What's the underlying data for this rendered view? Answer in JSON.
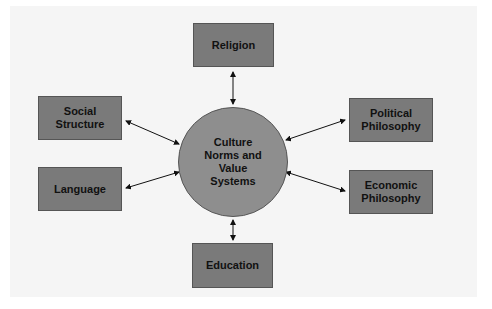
{
  "diagram": {
    "center": {
      "label": "Culture\nNorms and\nValue\nSystems"
    },
    "nodes": [
      {
        "id": "religion",
        "label": "Religion"
      },
      {
        "id": "social-structure",
        "label": "Social\nStructure"
      },
      {
        "id": "language",
        "label": "Language"
      },
      {
        "id": "political-philosophy",
        "label": "Political\nPhilosophy"
      },
      {
        "id": "economic-philosophy",
        "label": "Economic\nPhilosophy"
      },
      {
        "id": "education",
        "label": "Education"
      }
    ],
    "edges": [
      {
        "from": "religion",
        "to": "center",
        "type": "bidirectional"
      },
      {
        "from": "social-structure",
        "to": "center",
        "type": "bidirectional"
      },
      {
        "from": "language",
        "to": "center",
        "type": "bidirectional"
      },
      {
        "from": "political-philosophy",
        "to": "center",
        "type": "bidirectional"
      },
      {
        "from": "economic-philosophy",
        "to": "center",
        "type": "bidirectional"
      },
      {
        "from": "education",
        "to": "center",
        "type": "bidirectional"
      }
    ],
    "colors": {
      "box_fill": "#7a7a7a",
      "circle_fill": "#8e8e8e",
      "background": "#f5f5f5",
      "arrow": "#111111"
    }
  }
}
